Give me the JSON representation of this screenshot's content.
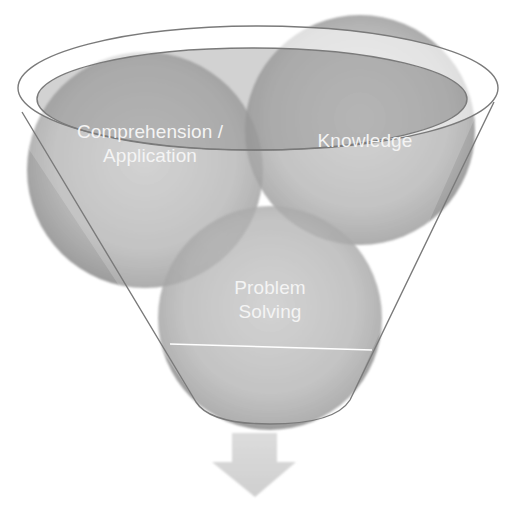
{
  "diagram": {
    "type": "funnel",
    "background": "#ffffff",
    "items": [
      {
        "id": "comprehension-application",
        "lines": [
          "Comprehension /",
          "Application"
        ],
        "circle": {
          "cx": 145,
          "cy": 170,
          "r": 118
        },
        "label_pos": {
          "x": 150,
          "y": 120
        }
      },
      {
        "id": "knowledge",
        "lines": [
          "Knowledge"
        ],
        "circle": {
          "cx": 360,
          "cy": 130,
          "r": 115
        },
        "label_pos": {
          "x": 365,
          "y": 129
        }
      },
      {
        "id": "problem-solving",
        "lines": [
          "Problem",
          "Solving"
        ],
        "circle": {
          "cx": 270,
          "cy": 318,
          "r": 112
        },
        "label_pos": {
          "x": 270,
          "y": 276
        }
      }
    ],
    "colors": {
      "circle_fill": "#8f8f8f",
      "circle_fill_light": "#b9b9b9",
      "funnel_stroke": "#7a7a7a",
      "rim_fill": "#ffffff",
      "label_text": "#f4f4f4",
      "arrow_fill": "#d6d6d6",
      "divider_line": "#ffffff"
    },
    "arrow": {
      "direction": "down"
    }
  }
}
